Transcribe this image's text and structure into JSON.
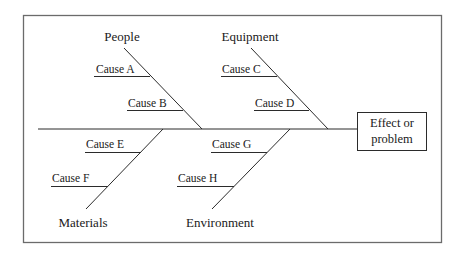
{
  "diagram": {
    "type": "fishbone",
    "effect": {
      "line1": "Effect or",
      "line2": "problem"
    },
    "categories": [
      {
        "name": "People",
        "position": "top",
        "causes": [
          "Cause A",
          "Cause B"
        ]
      },
      {
        "name": "Equipment",
        "position": "top",
        "causes": [
          "Cause C",
          "Cause D"
        ]
      },
      {
        "name": "Materials",
        "position": "bottom",
        "causes": [
          "Cause E",
          "Cause F"
        ]
      },
      {
        "name": "Environment",
        "position": "bottom",
        "causes": [
          "Cause G",
          "Cause H"
        ]
      }
    ]
  },
  "colors": {
    "line": "#2b2b2b",
    "frame": "#6b6b6b",
    "background": "#ffffff",
    "text": "#1a1a1a"
  }
}
